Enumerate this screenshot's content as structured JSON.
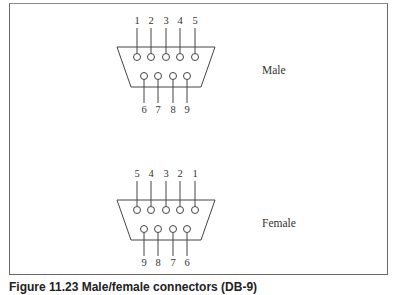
{
  "figure": {
    "connectors": [
      {
        "name": "male",
        "label": "Male",
        "top_pins": [
          "1",
          "2",
          "3",
          "4",
          "5"
        ],
        "bottom_pins": [
          "6",
          "7",
          "8",
          "9"
        ],
        "top_labels_above": true
      },
      {
        "name": "female",
        "label": "Female",
        "top_pins": [
          "5",
          "4",
          "3",
          "2",
          "1"
        ],
        "bottom_pins": [
          "9",
          "8",
          "7",
          "6"
        ],
        "top_labels_above": true
      }
    ],
    "caption": "Figure 11.23  Male/female connectors (DB-9)"
  }
}
